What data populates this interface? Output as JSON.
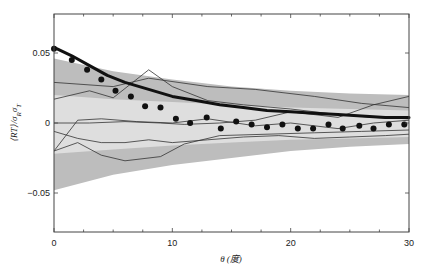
{
  "chart_data": {
    "type": "line",
    "title": "",
    "xlabel": "θ (度)",
    "ylabel": "⟨RT⟩/σ_R σ_T",
    "xlim": [
      0,
      30
    ],
    "ylim": [
      -0.075,
      0.08
    ],
    "xticks": [
      0,
      10,
      20,
      30
    ],
    "xtick_labels": [
      "0",
      "10",
      "20",
      "30"
    ],
    "yticks": [
      -0.05,
      0,
      0.05
    ],
    "ytick_labels": [
      "−0.05",
      "0",
      "0.05"
    ],
    "grid": false,
    "legend": null,
    "bands": [
      {
        "name": "outer-band (dark gray)",
        "color": "#bdbdbd",
        "x": [
          0,
          5,
          10,
          15,
          20,
          25,
          30
        ],
        "upper": [
          0.046,
          0.037,
          0.031,
          0.026,
          0.023,
          0.021,
          0.02
        ],
        "lower": [
          -0.048,
          -0.037,
          -0.03,
          -0.025,
          -0.02,
          -0.017,
          -0.015
        ]
      },
      {
        "name": "inner-band (light gray)",
        "color": "#dedede",
        "x": [
          0,
          5,
          10,
          15,
          20,
          25,
          30
        ],
        "upper": [
          0.02,
          0.017,
          0.015,
          0.013,
          0.011,
          0.01,
          0.009
        ],
        "lower": [
          -0.022,
          -0.019,
          -0.016,
          -0.014,
          -0.012,
          -0.011,
          -0.01
        ]
      }
    ],
    "series": [
      {
        "name": "model-curve (thick)",
        "style": "line",
        "width": 3,
        "color": "#111111",
        "x": [
          0,
          1.5,
          3,
          4.5,
          6,
          8,
          10,
          12,
          14,
          16,
          18,
          20,
          22,
          24,
          26,
          28,
          30
        ],
        "values": [
          0.054,
          0.048,
          0.041,
          0.034,
          0.029,
          0.024,
          0.019,
          0.016,
          0.013,
          0.011,
          0.009,
          0.008,
          0.007,
          0.006,
          0.005,
          0.004,
          0.004
        ]
      },
      {
        "name": "observed (dots)",
        "style": "scatter",
        "color": "#111111",
        "x": [
          0,
          1.5,
          2.8,
          4.0,
          5.2,
          6.5,
          7.7,
          9.0,
          10.3,
          11.5,
          12.9,
          14.1,
          15.4,
          16.7,
          18.0,
          19.3,
          20.6,
          21.9,
          23.2,
          24.4,
          25.8,
          27.0,
          28.3,
          29.6
        ],
        "values": [
          0.053,
          0.045,
          0.038,
          0.031,
          0.023,
          0.019,
          0.012,
          0.011,
          0.003,
          0.0,
          0.004,
          -0.004,
          0.001,
          -0.001,
          -0.003,
          -0.001,
          -0.004,
          -0.004,
          -0.001,
          -0.004,
          -0.002,
          -0.004,
          -0.001,
          -0.001
        ]
      },
      {
        "name": "sample-line-1",
        "style": "line",
        "width": 0.8,
        "color": "#333333",
        "x": [
          0,
          5,
          8,
          13,
          17,
          22,
          26,
          30
        ],
        "values": [
          0.029,
          0.026,
          0.032,
          0.026,
          0.024,
          0.019,
          0.014,
          0.011
        ]
      },
      {
        "name": "sample-line-2",
        "style": "line",
        "width": 0.8,
        "color": "#333333",
        "x": [
          0,
          3,
          5,
          8,
          10,
          13,
          16,
          20,
          24,
          27,
          30
        ],
        "values": [
          0.017,
          0.023,
          0.018,
          0.038,
          0.026,
          0.016,
          0.013,
          0.01,
          0.006,
          0.004,
          0.003
        ]
      },
      {
        "name": "sample-line-3",
        "style": "line",
        "width": 0.8,
        "color": "#333333",
        "x": [
          0,
          3,
          6,
          9,
          11,
          14,
          17,
          20,
          24,
          27,
          30
        ],
        "values": [
          0.0,
          0.0,
          0.001,
          0.0,
          -0.001,
          0.0,
          0.002,
          0.008,
          0.004,
          0.013,
          0.019
        ]
      },
      {
        "name": "sample-line-4",
        "style": "line",
        "width": 0.8,
        "color": "#333333",
        "x": [
          0,
          2,
          4,
          7,
          10,
          13,
          17,
          20,
          24,
          27,
          30
        ],
        "values": [
          -0.02,
          0.002,
          0.003,
          0.001,
          0.0,
          0.003,
          -0.002,
          0.0,
          -0.004,
          0.0,
          0.002
        ]
      },
      {
        "name": "sample-line-5",
        "style": "line",
        "width": 0.8,
        "color": "#333333",
        "x": [
          0,
          2,
          4,
          6,
          8,
          10,
          13,
          16,
          19,
          22,
          25,
          28,
          30
        ],
        "values": [
          -0.006,
          -0.011,
          -0.014,
          -0.014,
          -0.012,
          -0.014,
          -0.012,
          -0.01,
          -0.009,
          -0.011,
          -0.01,
          -0.009,
          -0.008
        ]
      },
      {
        "name": "sample-line-6",
        "style": "line",
        "width": 0.8,
        "color": "#333333",
        "x": [
          0,
          2,
          4,
          6,
          9,
          11,
          14,
          18,
          22,
          26,
          30
        ],
        "values": [
          -0.02,
          -0.014,
          -0.023,
          -0.027,
          -0.024,
          -0.015,
          -0.009,
          -0.008,
          -0.007,
          -0.006,
          -0.005
        ]
      }
    ]
  },
  "plot_area": {
    "left": 54,
    "right": 409,
    "top": 14,
    "bottom": 232
  }
}
